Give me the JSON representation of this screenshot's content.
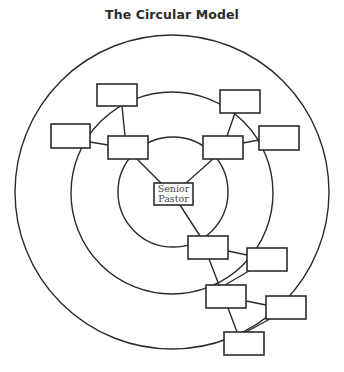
{
  "title": "The Circular Model",
  "center_node": {
    "line1": "Senior",
    "line2": "Pastor"
  },
  "rings": [
    {
      "name": "inner",
      "cx": 173,
      "cy": 192,
      "r": 55
    },
    {
      "name": "middle",
      "cx": 172,
      "cy": 193,
      "r": 101
    },
    {
      "name": "outer",
      "cx": 172,
      "cy": 192,
      "r": 157
    }
  ],
  "nodes": [
    {
      "id": "upper-left-top",
      "x": 97,
      "y": 84,
      "w": 40,
      "h": 22,
      "label": ""
    },
    {
      "id": "upper-left-outer",
      "x": 51,
      "y": 124,
      "w": 39,
      "h": 24,
      "label": ""
    },
    {
      "id": "upper-left-inner",
      "x": 108,
      "y": 136,
      "w": 40,
      "h": 23,
      "label": ""
    },
    {
      "id": "upper-right-top",
      "x": 220,
      "y": 90,
      "w": 40,
      "h": 23,
      "label": ""
    },
    {
      "id": "upper-right-outer",
      "x": 259,
      "y": 126,
      "w": 40,
      "h": 24,
      "label": ""
    },
    {
      "id": "upper-right-inner",
      "x": 203,
      "y": 136,
      "w": 40,
      "h": 23,
      "label": ""
    },
    {
      "id": "lower-1",
      "x": 188,
      "y": 236,
      "w": 40,
      "h": 23,
      "label": ""
    },
    {
      "id": "lower-2",
      "x": 247,
      "y": 248,
      "w": 40,
      "h": 23,
      "label": ""
    },
    {
      "id": "lower-3",
      "x": 206,
      "y": 285,
      "w": 40,
      "h": 23,
      "label": ""
    },
    {
      "id": "lower-4",
      "x": 266,
      "y": 296,
      "w": 40,
      "h": 23,
      "label": ""
    },
    {
      "id": "lower-5",
      "x": 224,
      "y": 332,
      "w": 40,
      "h": 23,
      "label": ""
    }
  ],
  "colors": {
    "line": "#2b2b2b",
    "background": "#ffffff"
  }
}
